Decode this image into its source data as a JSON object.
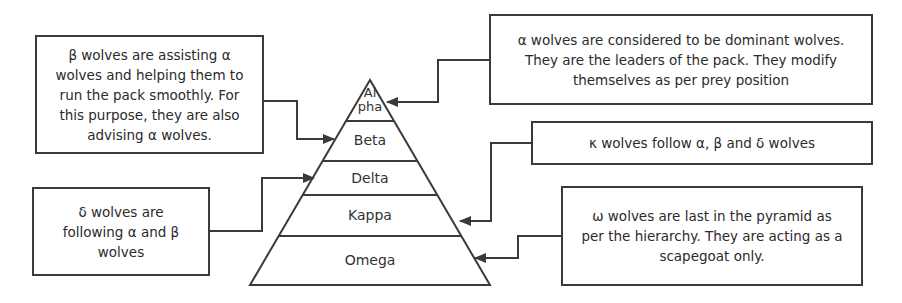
{
  "pyramid": {
    "layers": [
      {
        "id": "alpha",
        "label_line1": "Al",
        "label_line2": "pha"
      },
      {
        "id": "beta",
        "label": "Beta"
      },
      {
        "id": "delta",
        "label": "Delta"
      },
      {
        "id": "kappa",
        "label": "Kappa"
      },
      {
        "id": "omega",
        "label": "Omega"
      }
    ]
  },
  "callouts": {
    "alpha": "α wolves are considered to be dominant wolves. They are the leaders of the pack. They modify themselves as per prey position",
    "beta": "β wolves are assisting α wolves and helping them to run the pack smoothly. For this purpose, they are also advising α wolves.",
    "delta": "δ wolves are following α and β wolves",
    "kappa": "κ wolves follow α, β and δ wolves",
    "omega": "ω wolves are last in the pyramid as per the hierarchy. They are acting as a scapegoat only."
  },
  "colors": {
    "stroke": "#3a3a3a",
    "text": "#2b2b2b",
    "background": "#ffffff"
  }
}
